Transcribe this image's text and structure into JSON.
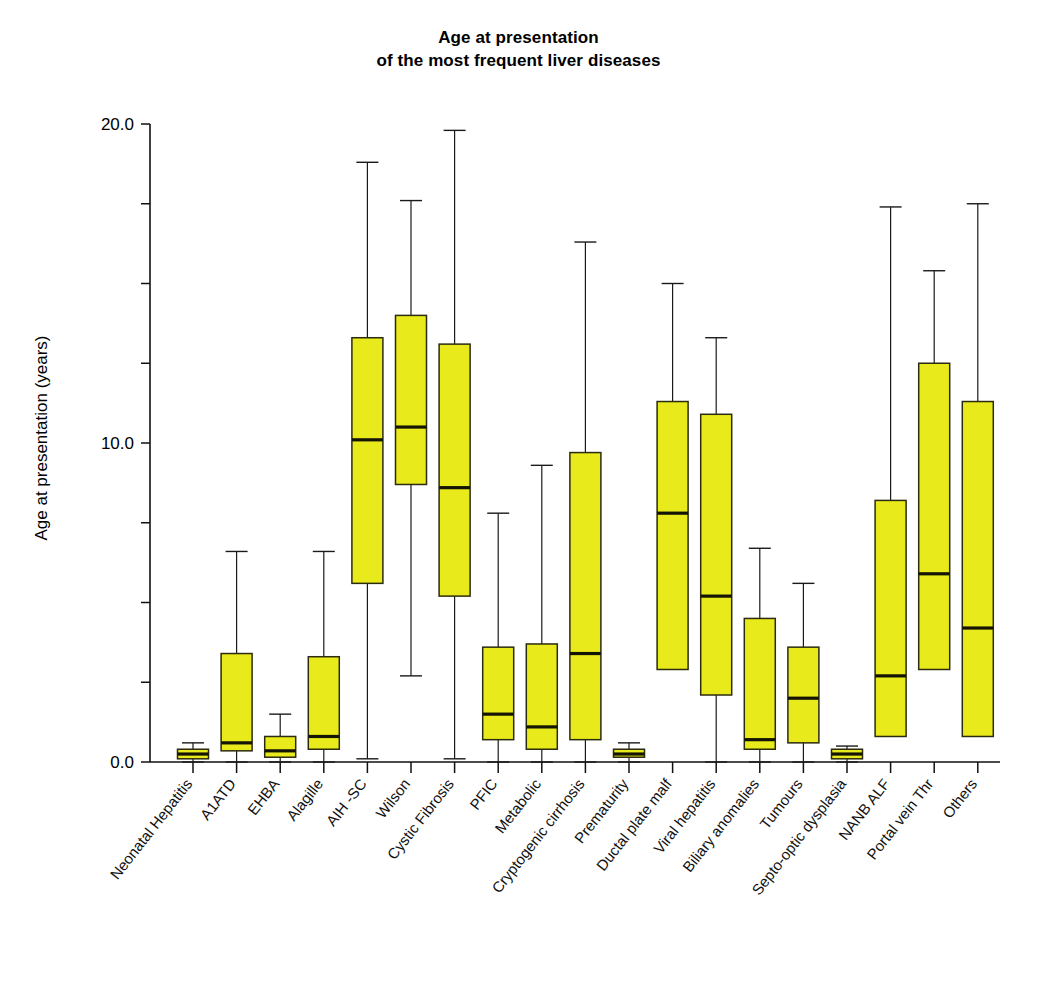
{
  "chart_data": {
    "type": "box",
    "title": "Age at presentation\nof the most frequent liver diseases",
    "xlabel": "",
    "ylabel": "Age at presentation (years)",
    "ylim": [
      0.0,
      20.0
    ],
    "ytick_labels": [
      "0.0",
      "10.0",
      "20.0"
    ],
    "ytick_values": [
      0.0,
      10.0,
      20.0
    ],
    "minor_tick_values": [
      2.5,
      5.0,
      7.5,
      12.5,
      15.0,
      17.5
    ],
    "grid": false,
    "legend": "none",
    "box_fill_color": "#e9ea1c",
    "box_edge_color": "#2b2b10",
    "categories": [
      "Neonatal Hepatitis",
      "A1ATD",
      "EHBA",
      "Alagille",
      "AIH -SC",
      "Wilson",
      "Cystic Fibrosis",
      "PFIC",
      "Metabolic",
      "Cryptogenic cirrhosis",
      "Prematurity",
      "Ductal plate malf",
      "Viral hepatitis",
      "Biliary anomalies",
      "Tumours",
      "Septo-optic dysplasia",
      "NANB ALF",
      "Portal vein Thr",
      "Others"
    ],
    "boxes": [
      {
        "category": "Neonatal Hepatitis",
        "whisker_low": 0.0,
        "q1": 0.1,
        "median": 0.25,
        "q3": 0.4,
        "whisker_high": 0.6
      },
      {
        "category": "A1ATD",
        "whisker_low": 0.0,
        "q1": 0.35,
        "median": 0.6,
        "q3": 3.4,
        "whisker_high": 6.6
      },
      {
        "category": "EHBA",
        "whisker_low": 0.0,
        "q1": 0.15,
        "median": 0.35,
        "q3": 0.8,
        "whisker_high": 1.5
      },
      {
        "category": "Alagille",
        "whisker_low": 0.0,
        "q1": 0.4,
        "median": 0.8,
        "q3": 3.3,
        "whisker_high": 6.6
      },
      {
        "category": "AIH -SC",
        "whisker_low": 0.1,
        "q1": 5.6,
        "median": 10.1,
        "q3": 13.3,
        "whisker_high": 18.8
      },
      {
        "category": "Wilson",
        "whisker_low": 2.7,
        "q1": 8.7,
        "median": 10.5,
        "q3": 14.0,
        "whisker_high": 17.6
      },
      {
        "category": "Cystic Fibrosis",
        "whisker_low": 0.1,
        "q1": 5.2,
        "median": 8.6,
        "q3": 13.1,
        "whisker_high": 19.8
      },
      {
        "category": "PFIC",
        "whisker_low": 0.0,
        "q1": 0.7,
        "median": 1.5,
        "q3": 3.6,
        "whisker_high": 7.8
      },
      {
        "category": "Metabolic",
        "whisker_low": 0.0,
        "q1": 0.4,
        "median": 1.1,
        "q3": 3.7,
        "whisker_high": 9.3
      },
      {
        "category": "Cryptogenic cirrhosis",
        "whisker_low": 0.0,
        "q1": 0.7,
        "median": 3.4,
        "q3": 9.7,
        "whisker_high": 16.3
      },
      {
        "category": "Prematurity",
        "whisker_low": 0.0,
        "q1": 0.15,
        "median": 0.25,
        "q3": 0.4,
        "whisker_high": 0.6
      },
      {
        "category": "Ductal plate malf",
        "whisker_low": 2.9,
        "q1": 2.9,
        "median": 7.8,
        "q3": 11.3,
        "whisker_high": 15.0
      },
      {
        "category": "Viral hepatitis",
        "whisker_low": 0.0,
        "q1": 2.1,
        "median": 5.2,
        "q3": 10.9,
        "whisker_high": 13.3
      },
      {
        "category": "Biliary anomalies",
        "whisker_low": 0.0,
        "q1": 0.4,
        "median": 0.7,
        "q3": 4.5,
        "whisker_high": 6.7
      },
      {
        "category": "Tumours",
        "whisker_low": 0.0,
        "q1": 0.6,
        "median": 2.0,
        "q3": 3.6,
        "whisker_high": 5.6
      },
      {
        "category": "Septo-optic dysplasia",
        "whisker_low": 0.0,
        "q1": 0.1,
        "median": 0.25,
        "q3": 0.4,
        "whisker_high": 0.5
      },
      {
        "category": "NANB ALF",
        "whisker_low": 0.8,
        "q1": 0.8,
        "median": 2.7,
        "q3": 8.2,
        "whisker_high": 17.4
      },
      {
        "category": "Portal vein Thr",
        "whisker_low": 2.9,
        "q1": 2.9,
        "median": 5.9,
        "q3": 12.5,
        "whisker_high": 15.4
      },
      {
        "category": "Others",
        "whisker_low": 0.8,
        "q1": 0.8,
        "median": 4.2,
        "q3": 11.3,
        "whisker_high": 17.5
      }
    ]
  }
}
